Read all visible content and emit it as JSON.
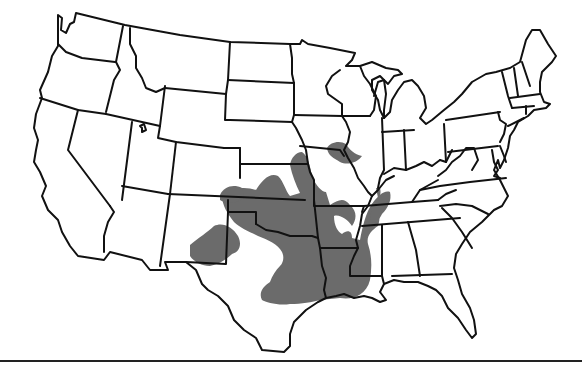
{
  "map": {
    "title": "Species range map — contiguous United States",
    "region": "Contiguous United States",
    "colors": {
      "background": "#ffffff",
      "state_outline": "#111111",
      "range_fill": "#6b6b6b",
      "rule": "#222222"
    },
    "range_states": [
      "Kansas",
      "Oklahoma",
      "Texas",
      "New Mexico",
      "Missouri",
      "Arkansas",
      "Louisiana",
      "Mississippi",
      "Tennessee",
      "Kentucky",
      "Illinois",
      "Iowa",
      "Nebraska",
      "Colorado"
    ],
    "legend": null
  }
}
